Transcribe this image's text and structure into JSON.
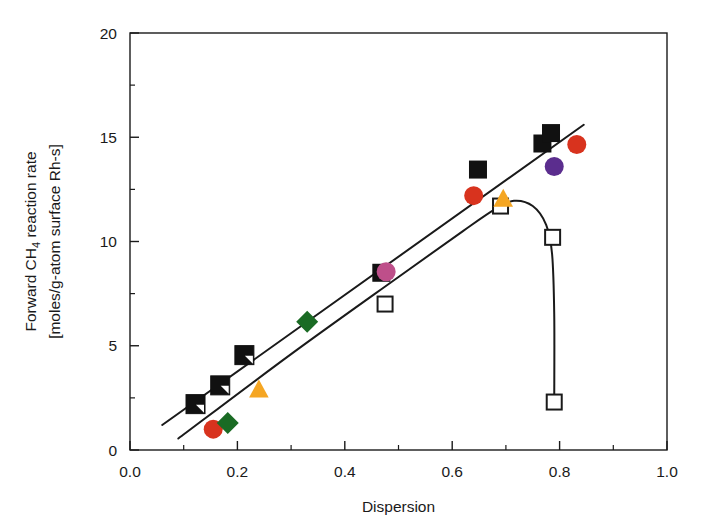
{
  "chart_data": {
    "type": "scatter",
    "title": "",
    "xlabel": "Dispersion",
    "ylabel_line1": "Forward CH4 reaction rate",
    "ylabel_line2": "[moles/g-atom surface Rh-s]",
    "ylabel_prefix": "Forward CH",
    "ylabel_sub": "4",
    "ylabel_suffix": " reaction rate",
    "xlim": [
      0.0,
      1.0
    ],
    "ylim": [
      0,
      20
    ],
    "xticks": [
      "0.0",
      "0.2",
      "0.4",
      "0.6",
      "0.8",
      "1.0"
    ],
    "xtick_values": [
      0.0,
      0.2,
      0.4,
      0.6,
      0.8,
      1.0
    ],
    "xminor_values": [
      0.1,
      0.3,
      0.5,
      0.7,
      0.9
    ],
    "yticks": [
      "0",
      "5",
      "10",
      "15",
      "20"
    ],
    "ytick_values": [
      0,
      5,
      10,
      15,
      20
    ],
    "yminor_values": [
      2.5,
      7.5,
      12.5,
      17.5
    ],
    "grid": false,
    "legend": "none",
    "colors": {
      "black": "#111111",
      "red": "#D8331E",
      "orange": "#F5A623",
      "green": "#1A6B24",
      "purple": "#5B2D8E",
      "magenta": "#BE4F8A",
      "white": "#FFFFFF",
      "axis": "#1a1a1a"
    },
    "series": [
      {
        "name": "half-filled squares",
        "marker": "square-half",
        "color": "#111111",
        "points": [
          {
            "x": 0.122,
            "y": 2.2
          },
          {
            "x": 0.168,
            "y": 3.1
          },
          {
            "x": 0.213,
            "y": 4.55
          }
        ]
      },
      {
        "name": "filled black squares",
        "marker": "square-filled",
        "color": "#111111",
        "points": [
          {
            "x": 0.468,
            "y": 8.5
          },
          {
            "x": 0.648,
            "y": 13.45
          },
          {
            "x": 0.768,
            "y": 14.7
          },
          {
            "x": 0.784,
            "y": 15.2
          }
        ]
      },
      {
        "name": "open squares",
        "marker": "square-open",
        "color": "#111111",
        "points": [
          {
            "x": 0.475,
            "y": 7.0
          },
          {
            "x": 0.69,
            "y": 11.7
          },
          {
            "x": 0.787,
            "y": 10.2
          },
          {
            "x": 0.79,
            "y": 2.3
          }
        ]
      },
      {
        "name": "red circles",
        "marker": "circle",
        "color": "#D8331E",
        "points": [
          {
            "x": 0.155,
            "y": 1.0
          },
          {
            "x": 0.64,
            "y": 12.2
          },
          {
            "x": 0.832,
            "y": 14.65
          }
        ]
      },
      {
        "name": "orange triangles",
        "marker": "triangle",
        "color": "#F5A623",
        "points": [
          {
            "x": 0.24,
            "y": 2.9
          },
          {
            "x": 0.695,
            "y": 12.05
          }
        ]
      },
      {
        "name": "green diamonds",
        "marker": "diamond",
        "color": "#1A6B24",
        "points": [
          {
            "x": 0.182,
            "y": 1.3
          },
          {
            "x": 0.33,
            "y": 6.15
          }
        ]
      },
      {
        "name": "purple circle",
        "marker": "circle",
        "color": "#5B2D8E",
        "points": [
          {
            "x": 0.79,
            "y": 13.6
          }
        ]
      },
      {
        "name": "magenta circle",
        "marker": "circle",
        "color": "#BE4F8A",
        "points": [
          {
            "x": 0.477,
            "y": 8.55
          }
        ]
      }
    ],
    "lines": [
      {
        "name": "upper trend line",
        "type": "straight",
        "points": [
          {
            "x": 0.06,
            "y": 1.2
          },
          {
            "x": 0.845,
            "y": 15.6
          }
        ]
      },
      {
        "name": "lower curve with drop",
        "type": "curve",
        "points": [
          {
            "x": 0.09,
            "y": 0.55
          },
          {
            "x": 0.3,
            "y": 4.6
          },
          {
            "x": 0.5,
            "y": 8.3
          },
          {
            "x": 0.62,
            "y": 10.5
          },
          {
            "x": 0.68,
            "y": 11.55
          },
          {
            "x": 0.715,
            "y": 11.95
          },
          {
            "x": 0.75,
            "y": 11.7
          },
          {
            "x": 0.775,
            "y": 10.8
          },
          {
            "x": 0.786,
            "y": 9.4
          },
          {
            "x": 0.79,
            "y": 6.5
          },
          {
            "x": 0.79,
            "y": 2.35
          }
        ]
      }
    ]
  }
}
